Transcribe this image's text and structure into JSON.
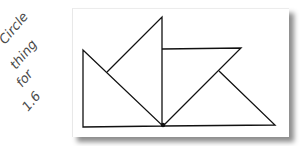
{
  "annotation": {
    "lines": [
      "Circle",
      "thing",
      "for",
      "1.6"
    ],
    "ink_color": "#444444"
  },
  "figure": {
    "stroke_color": "#111111",
    "card_color": "#ffffff",
    "shadow_color": "#8a8a8a",
    "shapes": [
      {
        "name": "left-right-triangle",
        "points": [
          [
            83,
            50
          ],
          [
            83,
            127
          ],
          [
            163,
            126
          ]
        ]
      },
      {
        "name": "tall-triangle",
        "points": [
          [
            162,
            17
          ],
          [
            162,
            126
          ],
          [
            107,
            72
          ]
        ]
      },
      {
        "name": "top-triangle",
        "points": [
          [
            162,
            49
          ],
          [
            241,
            48
          ],
          [
            163,
            126
          ]
        ]
      },
      {
        "name": "bottom-right-triangle",
        "points": [
          [
            219,
            71
          ],
          [
            275,
            125
          ],
          [
            163,
            126
          ]
        ]
      }
    ],
    "shared_vertex": [
      163,
      126
    ]
  }
}
